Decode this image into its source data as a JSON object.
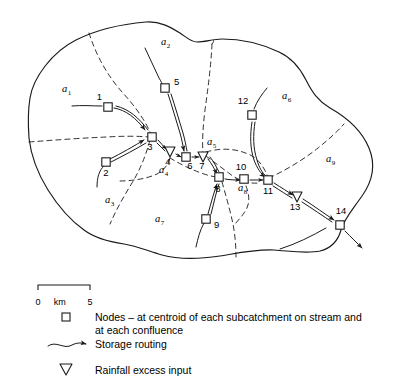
{
  "figure": {
    "kind": "hydrological-catchment-map",
    "title": ""
  },
  "subcatchments": [
    {
      "id": "a1",
      "label": "a",
      "sub": "1",
      "x": 62,
      "y": 92
    },
    {
      "id": "a2",
      "label": "a",
      "sub": "2",
      "x": 161,
      "y": 45
    },
    {
      "id": "a3",
      "label": "a",
      "sub": "3",
      "x": 105,
      "y": 203
    },
    {
      "id": "a4",
      "label": "a",
      "sub": "4",
      "x": 159,
      "y": 173
    },
    {
      "id": "a5",
      "label": "a",
      "sub": "5",
      "x": 207,
      "y": 145
    },
    {
      "id": "a6",
      "label": "a",
      "sub": "6",
      "x": 282,
      "y": 99
    },
    {
      "id": "a7",
      "label": "a",
      "sub": "7",
      "x": 155,
      "y": 222
    },
    {
      "id": "a8",
      "label": "a",
      "sub": "8",
      "x": 238,
      "y": 191
    },
    {
      "id": "a9",
      "label": "a",
      "sub": "9",
      "x": 326,
      "y": 162
    }
  ],
  "nodes": [
    {
      "id": 1,
      "label": "1",
      "shape": "square",
      "x": 108,
      "y": 107,
      "lx": 102,
      "ly": 100,
      "anchor": "end"
    },
    {
      "id": 2,
      "label": "2",
      "shape": "square",
      "x": 106,
      "y": 162,
      "lx": 106,
      "ly": 176,
      "anchor": "middle"
    },
    {
      "id": 3,
      "label": "3",
      "shape": "square",
      "x": 152,
      "y": 137,
      "lx": 150,
      "ly": 150,
      "anchor": "middle"
    },
    {
      "id": 4,
      "label": "4",
      "shape": "triangle",
      "x": 170,
      "y": 152,
      "lx": 168,
      "ly": 165,
      "anchor": "middle"
    },
    {
      "id": 5,
      "label": "5",
      "shape": "square",
      "x": 165,
      "y": 88,
      "lx": 174,
      "ly": 85,
      "anchor": "start"
    },
    {
      "id": 6,
      "label": "6",
      "shape": "square",
      "x": 186,
      "y": 157,
      "lx": 190,
      "ly": 169,
      "anchor": "middle"
    },
    {
      "id": 7,
      "label": "7",
      "shape": "triangle",
      "x": 203,
      "y": 157,
      "lx": 202,
      "ly": 169,
      "anchor": "middle"
    },
    {
      "id": 8,
      "label": "8",
      "shape": "square",
      "x": 219,
      "y": 177,
      "lx": 218,
      "ly": 192,
      "anchor": "middle"
    },
    {
      "id": 9,
      "label": "9",
      "shape": "square",
      "x": 206,
      "y": 219,
      "lx": 214,
      "ly": 228,
      "anchor": "start"
    },
    {
      "id": 10,
      "label": "10",
      "shape": "square",
      "x": 244,
      "y": 179,
      "lx": 241,
      "ly": 170,
      "anchor": "middle"
    },
    {
      "id": 11,
      "label": "11",
      "shape": "square",
      "x": 268,
      "y": 180,
      "lx": 268,
      "ly": 194,
      "anchor": "middle"
    },
    {
      "id": 12,
      "label": "12",
      "shape": "square",
      "x": 252,
      "y": 115,
      "lx": 243,
      "ly": 104,
      "anchor": "middle"
    },
    {
      "id": 13,
      "label": "13",
      "shape": "triangle",
      "x": 297,
      "y": 197,
      "lx": 295,
      "ly": 210,
      "anchor": "middle"
    },
    {
      "id": 14,
      "label": "14",
      "shape": "square",
      "x": 340,
      "y": 225,
      "lx": 341,
      "ly": 214,
      "anchor": "middle"
    }
  ],
  "scale_bar": {
    "left_label": "0",
    "unit_label": "km",
    "right_label": "5",
    "x": 38,
    "y": 285,
    "length": 52
  },
  "legend": {
    "items": [
      {
        "id": "nodes",
        "symbol": "square-outline-icon",
        "text_line1": "Nodes – at centroid of each subcatchment on stream and",
        "text_line2": "at each confluence"
      },
      {
        "id": "storage-routing",
        "symbol": "arrow-curve-icon",
        "text_line1": "Storage routing",
        "text_line2": ""
      },
      {
        "id": "rainfall-excess",
        "symbol": "triangle-down-icon",
        "text_line1": "Rainfall excess input",
        "text_line2": ""
      }
    ]
  },
  "colors": {
    "ink": "#1a1a1a",
    "paper": "#ffffff"
  }
}
